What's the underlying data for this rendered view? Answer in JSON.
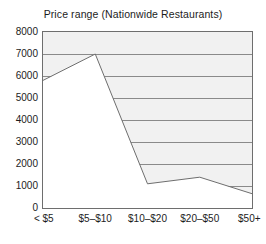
{
  "chart_data": {
    "type": "area",
    "title": "Price range (Nationwide Restaurants)",
    "xlabel": "",
    "ylabel": "",
    "categories": [
      "< $5",
      "$5–$10",
      "$10–$20",
      "$20–$50",
      "$50+"
    ],
    "values": [
      5800,
      7000,
      1100,
      1400,
      650
    ],
    "series": [
      {
        "name": "Number of restaurants",
        "values": [
          5800,
          7000,
          1100,
          1400,
          650
        ]
      }
    ],
    "ylim": [
      0,
      8000
    ],
    "y_ticks": [
      0,
      1000,
      2000,
      3000,
      4000,
      5000,
      6000,
      7000,
      8000
    ],
    "y_tick_labels": [
      "0",
      "1000",
      "2000",
      "3000",
      "4000",
      "5000",
      "6000",
      "7000",
      "8000"
    ],
    "grid": true,
    "grid_orientation": "horizontal",
    "legend": false,
    "legend_position": "none",
    "fill_region": "above-line",
    "colors": {
      "fill_above": "#f1f1f1",
      "line": "#6e6e6e",
      "grid": "#8a8a8a",
      "frame": "#6e6e6e",
      "text": "#1c1c1c",
      "plot_background": "#ffffff"
    }
  }
}
